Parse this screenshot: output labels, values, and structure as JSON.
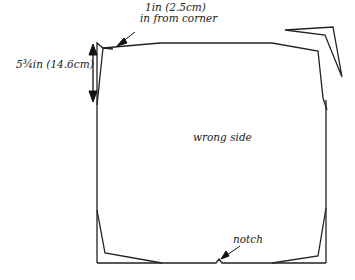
{
  "diagram": {
    "labels": {
      "corner_line1": "1in (2.5cm)",
      "corner_line2": "in from corner",
      "height": "5¾in (14.6cm)",
      "center": "wrong side",
      "notch": "notch"
    },
    "colors": {
      "stroke": "#222222",
      "background": "#ffffff"
    }
  }
}
